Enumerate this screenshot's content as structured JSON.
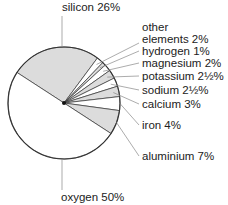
{
  "chart_data": {
    "type": "pie",
    "title": "",
    "slices": [
      {
        "name": "silicon",
        "value": 26,
        "label": "silicon 26%",
        "shaded": true
      },
      {
        "name": "other elements",
        "value": 2,
        "label": "other\nelements 2%",
        "shaded": false
      },
      {
        "name": "hydrogen",
        "value": 1,
        "label": "hydrogen 1%",
        "shaded": true
      },
      {
        "name": "magnesium",
        "value": 2,
        "label": "magnesium 2%",
        "shaded": false
      },
      {
        "name": "potassium",
        "value": 2.5,
        "label": "potassium 2½%",
        "shaded": true
      },
      {
        "name": "sodium",
        "value": 2.5,
        "label": "sodium 2½%",
        "shaded": false
      },
      {
        "name": "calcium",
        "value": 3,
        "label": "calcium  3%",
        "shaded": true
      },
      {
        "name": "iron",
        "value": 4,
        "label": "iron 4%",
        "shaded": false
      },
      {
        "name": "aluminium",
        "value": 7,
        "label": "aluminium 7%",
        "shaded": true
      },
      {
        "name": "oxygen",
        "value": 50,
        "label": "oxygen 50%",
        "shaded": false
      }
    ],
    "colors": {
      "shaded": "#dcdcdc",
      "unshaded": "#ffffff",
      "stroke": "#333333",
      "leader": "#888888"
    }
  }
}
